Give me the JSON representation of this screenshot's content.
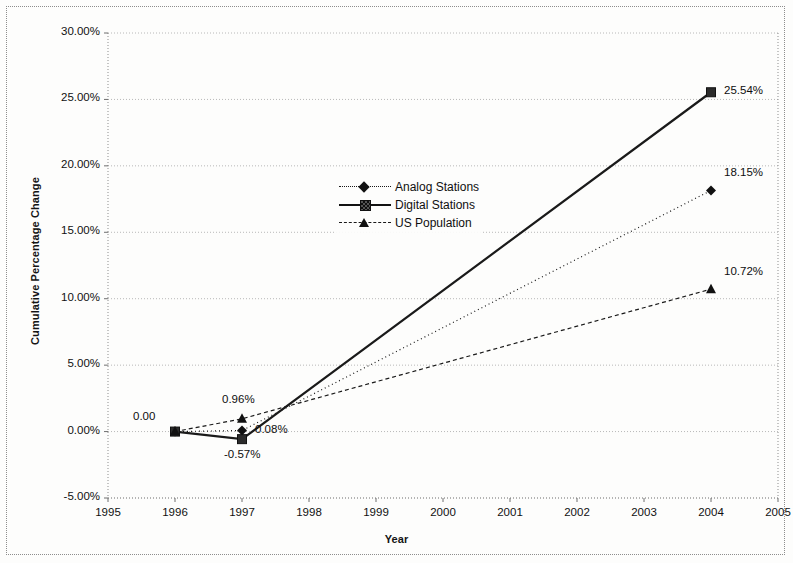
{
  "chart_data": {
    "type": "line",
    "title": "",
    "xlabel": "Year",
    "ylabel": "Cumulative Percentage Change",
    "x": [
      1996,
      1997,
      2004
    ],
    "xlim": [
      1995,
      2005
    ],
    "ylim": [
      -5,
      30
    ],
    "grid": true,
    "legend_position": "center-left-upper",
    "x_tick_labels": [
      "1995",
      "1996",
      "1997",
      "1998",
      "1999",
      "2000",
      "2001",
      "2002",
      "2003",
      "2004",
      "2005"
    ],
    "y_tick_labels": [
      "-5.00%",
      "0.00%",
      "5.00%",
      "10.00%",
      "15.00%",
      "20.00%",
      "25.00%",
      "30.00%"
    ],
    "y_ticks": [
      -5,
      0,
      5,
      10,
      15,
      20,
      25,
      30
    ],
    "series": [
      {
        "name": "Analog Stations",
        "marker": "diamond",
        "line_style": "dotted",
        "values": [
          0.0,
          0.08,
          18.15
        ],
        "labels": [
          "0.00",
          "0.08%",
          "18.15%"
        ]
      },
      {
        "name": "Digital Stations",
        "marker": "square",
        "line_style": "solid",
        "values": [
          0.0,
          -0.57,
          25.54
        ],
        "labels": [
          "",
          "-0.57%",
          "25.54%"
        ]
      },
      {
        "name": "US Population",
        "marker": "triangle",
        "line_style": "dashed",
        "values": [
          0.0,
          0.96,
          10.72
        ],
        "labels": [
          "",
          "0.96%",
          "10.72%"
        ]
      }
    ],
    "annotations": [
      {
        "text": "0.00",
        "x": 1996,
        "y": 0.0,
        "placement": "above-left"
      },
      {
        "text": "0.96%",
        "x": 1997,
        "y": 0.96,
        "placement": "above"
      },
      {
        "text": "0.08%",
        "x": 1997,
        "y": 0.08,
        "placement": "right"
      },
      {
        "text": "-0.57%",
        "x": 1997,
        "y": -0.57,
        "placement": "below"
      },
      {
        "text": "25.54%",
        "x": 2004,
        "y": 25.54,
        "placement": "right"
      },
      {
        "text": "18.15%",
        "x": 2004,
        "y": 18.15,
        "placement": "above-right"
      },
      {
        "text": "10.72%",
        "x": 2004,
        "y": 10.72,
        "placement": "above-right"
      }
    ],
    "colors": {
      "series_line": "#1a1a1a",
      "gridline": "#b8b8b8",
      "axis": "#8d8d8d",
      "background": "#fdfdfc"
    }
  },
  "legend": {
    "items": [
      {
        "label": "Analog Stations"
      },
      {
        "label": "Digital Stations"
      },
      {
        "label": "US Population"
      }
    ]
  },
  "axes": {
    "x_title": "Year",
    "y_title": "Cumulative Percentage Change"
  }
}
